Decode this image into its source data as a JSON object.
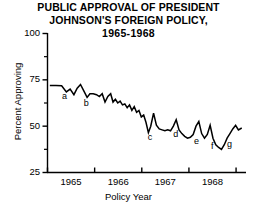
{
  "chart_data": {
    "type": "line",
    "title": "PUBLIC APPROVAL OF PRESIDENT JOHNSON'S FOREIGN POLICY, 1965-1968",
    "title_lines": [
      "PUBLIC APPROVAL OF PRESIDENT",
      "JOHNSON'S FOREIGN POLICY,",
      "1965-1968"
    ],
    "xlabel": "Policy Year",
    "ylabel": "Percent Approving",
    "xlim": [
      1964.7,
      1968.9
    ],
    "ylim": [
      25,
      100
    ],
    "yticks": [
      25,
      50,
      75,
      100
    ],
    "ytick_labels": [
      "25",
      "50",
      "75",
      "100"
    ],
    "yticks_minor": [
      37.5,
      62.5,
      87.5
    ],
    "xticks": [
      1964.7,
      1965.7,
      1966.7,
      1967.7,
      1968.7
    ],
    "xtick_labels": [
      "1965",
      "1966",
      "1967",
      "1968"
    ],
    "xtick_label_positions": [
      1965.2,
      1966.2,
      1967.2,
      1968.2
    ],
    "grid": false,
    "legend": false,
    "line_color": "#000000",
    "series": [
      {
        "name": "Percent Approving",
        "x": [
          1964.75,
          1964.88,
          1965.0,
          1965.1,
          1965.18,
          1965.26,
          1965.33,
          1965.4,
          1965.47,
          1965.54,
          1965.6,
          1965.67,
          1965.74,
          1965.8,
          1965.86,
          1965.92,
          1965.98,
          1966.04,
          1966.09,
          1966.14,
          1966.19,
          1966.24,
          1966.29,
          1966.34,
          1966.39,
          1966.44,
          1966.49,
          1966.54,
          1966.59,
          1966.64,
          1966.69,
          1966.74,
          1966.79,
          1966.84,
          1966.89,
          1966.95,
          1967.01,
          1967.07,
          1967.13,
          1967.19,
          1967.25,
          1967.31,
          1967.37,
          1967.43,
          1967.49,
          1967.55,
          1967.61,
          1967.67,
          1967.73,
          1967.79,
          1967.85,
          1967.91,
          1967.97,
          1968.03,
          1968.09,
          1968.15,
          1968.21,
          1968.27,
          1968.33,
          1968.39,
          1968.45,
          1968.51,
          1968.57,
          1968.63,
          1968.69,
          1968.75,
          1968.82
        ],
        "y": [
          72.0,
          72.0,
          71.8,
          68.5,
          70.0,
          67.0,
          70.5,
          72.5,
          69.0,
          65.5,
          67.5,
          67.5,
          67.0,
          66.0,
          67.5,
          63.0,
          66.0,
          67.5,
          63.0,
          64.5,
          62.5,
          63.5,
          61.5,
          62.0,
          60.0,
          61.5,
          58.5,
          60.5,
          57.5,
          58.5,
          55.0,
          56.0,
          52.0,
          46.5,
          50.0,
          57.0,
          50.5,
          48.5,
          48.0,
          47.5,
          48.0,
          47.5,
          50.0,
          53.5,
          48.0,
          46.0,
          44.5,
          43.5,
          44.0,
          45.5,
          50.0,
          52.5,
          46.0,
          43.5,
          45.5,
          50.5,
          43.5,
          40.0,
          38.5,
          37.5,
          40.0,
          43.5,
          46.0,
          48.5,
          50.5,
          48.0,
          49.0
        ]
      }
    ],
    "annotations": [
      {
        "label": "a",
        "x": 1965.06,
        "y": 66.0
      },
      {
        "label": "b",
        "x": 1965.52,
        "y": 62.0
      },
      {
        "label": "c",
        "x": 1966.88,
        "y": 44.0
      },
      {
        "label": "d",
        "x": 1967.42,
        "y": 45.5
      },
      {
        "label": "e",
        "x": 1967.86,
        "y": 41.5
      },
      {
        "label": "f",
        "x": 1968.22,
        "y": 39.0
      },
      {
        "label": "g",
        "x": 1968.56,
        "y": 40.0
      }
    ]
  }
}
